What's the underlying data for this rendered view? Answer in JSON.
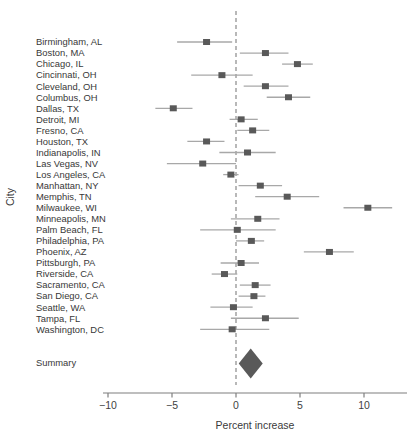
{
  "figure": {
    "colors": {
      "marker": "#595959",
      "ci_line": "#a8a8a8",
      "zero_line": "#7f7f7f",
      "axis": "#7f7f7f",
      "text": "#383838",
      "diamond": "#595959"
    }
  },
  "chart_data": {
    "type": "forest",
    "title": "",
    "xlabel": "Percent increase",
    "ylabel": "City",
    "xlim": [
      -10.5,
      13.4
    ],
    "x_ticks": [
      -10,
      -5,
      0,
      5,
      10
    ],
    "x_tick_labels": [
      "−10",
      "−5",
      "0",
      "5",
      "10"
    ],
    "zero_reference": 0,
    "grid": false,
    "cities": [
      {
        "label": "Birmingham, AL",
        "estimate": -2.3,
        "ci_low": -4.6,
        "ci_high": -0.3
      },
      {
        "label": "Boston, MA",
        "estimate": 2.3,
        "ci_low": 0.3,
        "ci_high": 4.1
      },
      {
        "label": "Chicago, IL",
        "estimate": 4.8,
        "ci_low": 3.6,
        "ci_high": 6.0
      },
      {
        "label": "Cincinnati, OH",
        "estimate": -1.1,
        "ci_low": -3.5,
        "ci_high": 1.3
      },
      {
        "label": "Cleveland, OH",
        "estimate": 2.3,
        "ci_low": 0.6,
        "ci_high": 4.1
      },
      {
        "label": "Columbus, OH",
        "estimate": 4.1,
        "ci_low": 2.4,
        "ci_high": 5.8
      },
      {
        "label": "Dallas, TX",
        "estimate": -4.9,
        "ci_low": -6.3,
        "ci_high": -3.4
      },
      {
        "label": "Detroit, MI",
        "estimate": 0.4,
        "ci_low": -0.5,
        "ci_high": 1.7
      },
      {
        "label": "Fresno, CA",
        "estimate": 1.3,
        "ci_low": 0.1,
        "ci_high": 2.6
      },
      {
        "label": "Houston, TX",
        "estimate": -2.3,
        "ci_low": -3.8,
        "ci_high": -0.9
      },
      {
        "label": "Indianapolis, IN",
        "estimate": 0.9,
        "ci_low": -1.3,
        "ci_high": 3.1
      },
      {
        "label": "Las Vegas, NV",
        "estimate": -2.6,
        "ci_low": -5.4,
        "ci_high": 0.0
      },
      {
        "label": "Los Angeles, CA",
        "estimate": -0.4,
        "ci_low": -1.0,
        "ci_high": 0.2
      },
      {
        "label": "Manhattan, NY",
        "estimate": 1.9,
        "ci_low": 0.2,
        "ci_high": 3.6
      },
      {
        "label": "Memphis, TN",
        "estimate": 4.0,
        "ci_low": 1.5,
        "ci_high": 6.5
      },
      {
        "label": "Milwaukee, WI",
        "estimate": 10.3,
        "ci_low": 8.4,
        "ci_high": 12.2
      },
      {
        "label": "Minneapolis, MN",
        "estimate": 1.7,
        "ci_low": -0.4,
        "ci_high": 3.4
      },
      {
        "label": "Palm Beach, FL",
        "estimate": 0.1,
        "ci_low": -2.8,
        "ci_high": 3.1
      },
      {
        "label": "Philadelphia, PA",
        "estimate": 1.2,
        "ci_low": 0.0,
        "ci_high": 2.2
      },
      {
        "label": "Phoenix, AZ",
        "estimate": 7.3,
        "ci_low": 5.3,
        "ci_high": 9.2
      },
      {
        "label": "Pittsburgh, PA",
        "estimate": 0.4,
        "ci_low": -1.2,
        "ci_high": 1.8
      },
      {
        "label": "Riverside, CA",
        "estimate": -0.9,
        "ci_low": -1.9,
        "ci_high": 0.1
      },
      {
        "label": "Sacramento, CA",
        "estimate": 1.5,
        "ci_low": 0.3,
        "ci_high": 2.7
      },
      {
        "label": "San Diego, CA",
        "estimate": 1.4,
        "ci_low": 0.2,
        "ci_high": 2.3
      },
      {
        "label": "Seattle, WA",
        "estimate": -0.2,
        "ci_low": -2.0,
        "ci_high": 1.3
      },
      {
        "label": "Tampa, FL",
        "estimate": 2.3,
        "ci_low": -0.4,
        "ci_high": 4.9
      },
      {
        "label": "Washington, DC",
        "estimate": -0.3,
        "ci_low": -2.8,
        "ci_high": 2.6
      }
    ],
    "summary": {
      "label": "Summary",
      "estimate": 1.15,
      "ci_low": 0.2,
      "ci_high": 2.1
    }
  }
}
